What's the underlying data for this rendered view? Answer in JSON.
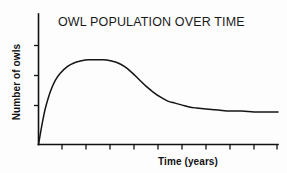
{
  "figure": {
    "title": "OWL POPULATION OVER TIME",
    "xlabel": "Time (years)",
    "ylabel": "Number of owls",
    "background_color": "#fdfdfd",
    "line_color": "#141414",
    "axis_color": "#111111"
  },
  "chart_data": {
    "type": "line",
    "title": "OWL POPULATION OVER TIME",
    "subtitle": "",
    "xlabel": "Time (years)",
    "ylabel": "Number of owls",
    "xlim": [
      0,
      100
    ],
    "ylim": [
      0,
      100
    ],
    "grid": false,
    "legend": null,
    "legend_position": "none",
    "x_tick_labels": [],
    "y_tick_labels": [],
    "x_tick_count": 10,
    "y_tick_count": 3,
    "annotations": [],
    "series": [
      {
        "name": "Owl population",
        "color": "#141414",
        "x": [
          0,
          1,
          2,
          3,
          5,
          7,
          9,
          12,
          15,
          18,
          21,
          24,
          27,
          30,
          33,
          36,
          39,
          42,
          45,
          48,
          51,
          54,
          57,
          60,
          63,
          66,
          70,
          75,
          80,
          85,
          90,
          95,
          100
        ],
        "y": [
          0,
          14,
          27,
          38,
          54,
          65,
          72,
          79,
          83,
          85,
          86,
          86,
          86,
          85,
          83,
          79,
          73,
          66,
          59,
          53,
          48,
          44,
          42,
          40,
          38,
          37,
          36,
          35,
          34,
          34,
          33,
          33,
          33
        ]
      }
    ],
    "key_points": {
      "start": {
        "x": 0,
        "y": 0,
        "label": "origin"
      },
      "peak": {
        "x": 22,
        "y": 86,
        "label": "overshoot peak"
      },
      "carrying_capacity": {
        "x": 100,
        "y": 33,
        "label": "stable level"
      }
    }
  }
}
